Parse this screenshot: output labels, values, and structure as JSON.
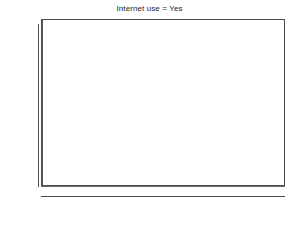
{
  "chart_data": {
    "type": "bar",
    "title": "Internet use = Yes",
    "subtitle": "",
    "xlabel": "",
    "ylabel": "",
    "xlim": [
      -4.9,
      4.1
    ],
    "ylim": [
      0,
      315
    ],
    "grid": false,
    "legend": null,
    "bin_width": 0.5,
    "bar_color": "#c8c8c8",
    "bar_edge_color": "#555555",
    "reference_line_x": 0,
    "y_ticks": [
      0,
      50,
      100,
      150,
      200,
      250,
      300
    ],
    "y_tick_labels": [
      "0",
      "50",
      "100",
      "150",
      "200",
      "250",
      "300"
    ],
    "x_ticks": [
      -4,
      -2,
      0,
      2,
      4
    ],
    "x_tick_labels": [
      "-4",
      "-2",
      "0",
      "2",
      "4"
    ],
    "bins": [
      {
        "x_left": -2.5,
        "x_right": -2.0,
        "center": -2.25,
        "value": 5
      },
      {
        "x_left": -2.0,
        "x_right": -1.5,
        "center": -1.75,
        "value": 18
      },
      {
        "x_left": -1.5,
        "x_right": -1.0,
        "center": -1.25,
        "value": 33
      },
      {
        "x_left": -1.0,
        "x_right": -0.5,
        "center": -0.75,
        "value": 92
      },
      {
        "x_left": -0.5,
        "x_right": 0.0,
        "center": -0.25,
        "value": 210
      },
      {
        "x_left": 0.0,
        "x_right": 0.5,
        "center": 0.25,
        "value": 253
      },
      {
        "x_left": 0.5,
        "x_right": 1.0,
        "center": 0.75,
        "value": 258
      },
      {
        "x_left": 1.0,
        "x_right": 1.5,
        "center": 1.25,
        "value": 197
      },
      {
        "x_left": 1.5,
        "x_right": 2.0,
        "center": 1.75,
        "value": 155
      },
      {
        "x_left": 2.0,
        "x_right": 2.5,
        "center": 2.25,
        "value": 67
      },
      {
        "x_left": 2.5,
        "x_right": 3.0,
        "center": 2.75,
        "value": 15
      },
      {
        "x_left": 3.0,
        "x_right": 3.5,
        "center": 3.25,
        "value": 2
      }
    ]
  }
}
